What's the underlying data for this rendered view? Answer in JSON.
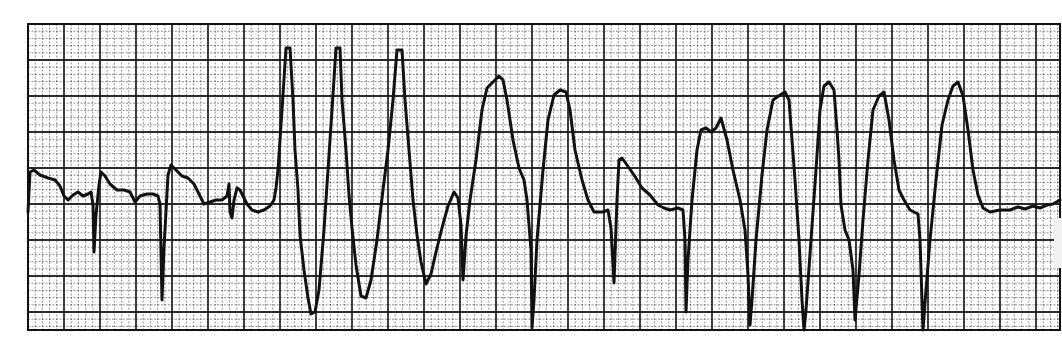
{
  "chart_data": {
    "type": "line",
    "title": "",
    "xlabel": "",
    "ylabel": "",
    "grid": {
      "on": true,
      "x0": 28,
      "y0": 24,
      "x1": 1060,
      "y1": 330,
      "minor_spacing_px": 7.2,
      "major_spacing_px": 36,
      "line_color": "#1a1a1a"
    },
    "trace_color": "#111111",
    "trace_points": [
      [
        28,
        212
      ],
      [
        30,
        172
      ],
      [
        34,
        170
      ],
      [
        40,
        175
      ],
      [
        48,
        178
      ],
      [
        55,
        180
      ],
      [
        60,
        186
      ],
      [
        64,
        196
      ],
      [
        68,
        200
      ],
      [
        73,
        195
      ],
      [
        78,
        192
      ],
      [
        83,
        196
      ],
      [
        88,
        194
      ],
      [
        91,
        192
      ],
      [
        93,
        205
      ],
      [
        94,
        252
      ],
      [
        96,
        215
      ],
      [
        99,
        185
      ],
      [
        101,
        172
      ],
      [
        105,
        176
      ],
      [
        110,
        184
      ],
      [
        117,
        190
      ],
      [
        124,
        190
      ],
      [
        130,
        192
      ],
      [
        135,
        202
      ],
      [
        140,
        196
      ],
      [
        147,
        194
      ],
      [
        153,
        194
      ],
      [
        158,
        196
      ],
      [
        160,
        204
      ],
      [
        162,
        300
      ],
      [
        164,
        248
      ],
      [
        168,
        175
      ],
      [
        171,
        165
      ],
      [
        176,
        170
      ],
      [
        182,
        176
      ],
      [
        188,
        178
      ],
      [
        194,
        184
      ],
      [
        200,
        196
      ],
      [
        204,
        204
      ],
      [
        210,
        202
      ],
      [
        216,
        200
      ],
      [
        222,
        200
      ],
      [
        227,
        196
      ],
      [
        229,
        184
      ],
      [
        230,
        212
      ],
      [
        232,
        218
      ],
      [
        234,
        200
      ],
      [
        237,
        188
      ],
      [
        240,
        190
      ],
      [
        244,
        198
      ],
      [
        247,
        204
      ],
      [
        252,
        210
      ],
      [
        258,
        212
      ],
      [
        264,
        210
      ],
      [
        270,
        206
      ],
      [
        274,
        200
      ],
      [
        276,
        188
      ],
      [
        278,
        170
      ],
      [
        282,
        110
      ],
      [
        286,
        48
      ],
      [
        290,
        48
      ],
      [
        293,
        100
      ],
      [
        295,
        150
      ],
      [
        298,
        190
      ],
      [
        300,
        235
      ],
      [
        304,
        270
      ],
      [
        308,
        298
      ],
      [
        311,
        314
      ],
      [
        315,
        312
      ],
      [
        319,
        290
      ],
      [
        324,
        230
      ],
      [
        328,
        170
      ],
      [
        332,
        110
      ],
      [
        336,
        48
      ],
      [
        340,
        48
      ],
      [
        342,
        100
      ],
      [
        346,
        150
      ],
      [
        349,
        195
      ],
      [
        352,
        228
      ],
      [
        356,
        265
      ],
      [
        361,
        296
      ],
      [
        366,
        298
      ],
      [
        371,
        280
      ],
      [
        377,
        240
      ],
      [
        383,
        190
      ],
      [
        388,
        150
      ],
      [
        393,
        100
      ],
      [
        397,
        50
      ],
      [
        402,
        50
      ],
      [
        405,
        100
      ],
      [
        409,
        150
      ],
      [
        413,
        200
      ],
      [
        417,
        235
      ],
      [
        421,
        262
      ],
      [
        426,
        284
      ],
      [
        431,
        274
      ],
      [
        436,
        252
      ],
      [
        442,
        228
      ],
      [
        448,
        206
      ],
      [
        454,
        192
      ],
      [
        458,
        198
      ],
      [
        461,
        225
      ],
      [
        463,
        280
      ],
      [
        466,
        236
      ],
      [
        470,
        200
      ],
      [
        476,
        160
      ],
      [
        482,
        110
      ],
      [
        487,
        88
      ],
      [
        493,
        82
      ],
      [
        499,
        76
      ],
      [
        503,
        80
      ],
      [
        507,
        100
      ],
      [
        513,
        140
      ],
      [
        519,
        168
      ],
      [
        524,
        180
      ],
      [
        527,
        200
      ],
      [
        531,
        250
      ],
      [
        532,
        328
      ],
      [
        534,
        300
      ],
      [
        537,
        240
      ],
      [
        543,
        170
      ],
      [
        548,
        120
      ],
      [
        554,
        95
      ],
      [
        560,
        90
      ],
      [
        566,
        92
      ],
      [
        570,
        110
      ],
      [
        575,
        150
      ],
      [
        582,
        180
      ],
      [
        588,
        200
      ],
      [
        594,
        212
      ],
      [
        603,
        212
      ],
      [
        608,
        210
      ],
      [
        611,
        228
      ],
      [
        614,
        283
      ],
      [
        617,
        200
      ],
      [
        619,
        160
      ],
      [
        622,
        158
      ],
      [
        627,
        165
      ],
      [
        634,
        175
      ],
      [
        642,
        188
      ],
      [
        650,
        195
      ],
      [
        658,
        205
      ],
      [
        664,
        208
      ],
      [
        670,
        210
      ],
      [
        678,
        208
      ],
      [
        683,
        210
      ],
      [
        685,
        240
      ],
      [
        686,
        312
      ],
      [
        688,
        260
      ],
      [
        692,
        200
      ],
      [
        697,
        150
      ],
      [
        701,
        130
      ],
      [
        706,
        128
      ],
      [
        711,
        132
      ],
      [
        716,
        128
      ],
      [
        721,
        118
      ],
      [
        727,
        140
      ],
      [
        733,
        170
      ],
      [
        740,
        200
      ],
      [
        745,
        230
      ],
      [
        748,
        275
      ],
      [
        750,
        325
      ],
      [
        752,
        300
      ],
      [
        756,
        240
      ],
      [
        762,
        175
      ],
      [
        767,
        130
      ],
      [
        773,
        100
      ],
      [
        780,
        95
      ],
      [
        785,
        92
      ],
      [
        789,
        100
      ],
      [
        792,
        140
      ],
      [
        795,
        180
      ],
      [
        799,
        240
      ],
      [
        802,
        300
      ],
      [
        804,
        330
      ],
      [
        806,
        310
      ],
      [
        811,
        240
      ],
      [
        816,
        170
      ],
      [
        820,
        110
      ],
      [
        824,
        86
      ],
      [
        829,
        82
      ],
      [
        834,
        90
      ],
      [
        837,
        130
      ],
      [
        839,
        160
      ],
      [
        841,
        205
      ],
      [
        845,
        230
      ],
      [
        849,
        240
      ],
      [
        853,
        270
      ],
      [
        855,
        320
      ],
      [
        859,
        275
      ],
      [
        863,
        220
      ],
      [
        868,
        160
      ],
      [
        873,
        110
      ],
      [
        879,
        96
      ],
      [
        884,
        92
      ],
      [
        889,
        120
      ],
      [
        894,
        160
      ],
      [
        899,
        190
      ],
      [
        904,
        200
      ],
      [
        910,
        210
      ],
      [
        918,
        214
      ],
      [
        920,
        240
      ],
      [
        922,
        300
      ],
      [
        923,
        330
      ],
      [
        926,
        290
      ],
      [
        930,
        240
      ],
      [
        936,
        180
      ],
      [
        942,
        125
      ],
      [
        948,
        100
      ],
      [
        953,
        86
      ],
      [
        958,
        82
      ],
      [
        963,
        96
      ],
      [
        968,
        130
      ],
      [
        973,
        170
      ],
      [
        978,
        195
      ],
      [
        983,
        208
      ],
      [
        990,
        212
      ],
      [
        1000,
        210
      ],
      [
        1010,
        210
      ],
      [
        1018,
        207
      ],
      [
        1025,
        209
      ],
      [
        1033,
        206
      ],
      [
        1040,
        208
      ],
      [
        1047,
        205
      ],
      [
        1053,
        204
      ],
      [
        1060,
        200
      ]
    ]
  },
  "strip": {
    "label": "ECG rhythm strip"
  }
}
